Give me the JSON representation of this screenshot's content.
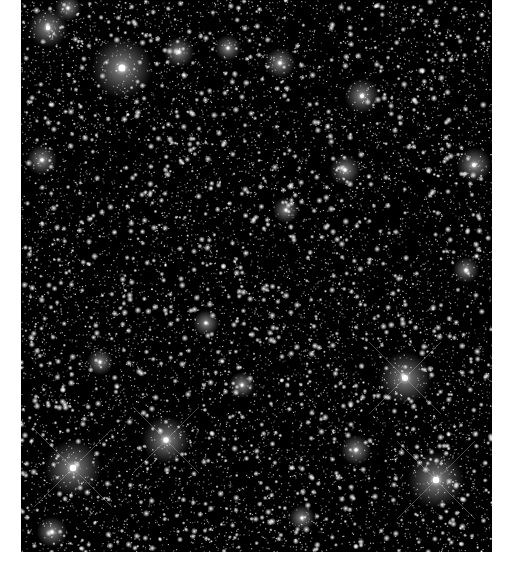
{
  "image": {
    "subject": "dense star field",
    "background_color": "#000000",
    "page_background": "#ffffff",
    "field": {
      "x": 21,
      "y": 0,
      "width": 471,
      "height": 552
    }
  },
  "stars": {
    "faint_count": 9000,
    "medium_count": 1400,
    "color": "#ffffff",
    "seed": 7
  },
  "bright_stars": [
    {
      "x": 122,
      "y": 68,
      "r": 14,
      "spikes": false
    },
    {
      "x": 48,
      "y": 28,
      "r": 9,
      "spikes": false
    },
    {
      "x": 68,
      "y": 8,
      "r": 6,
      "spikes": false
    },
    {
      "x": 179,
      "y": 52,
      "r": 7,
      "spikes": false
    },
    {
      "x": 228,
      "y": 48,
      "r": 6,
      "spikes": false
    },
    {
      "x": 280,
      "y": 63,
      "r": 7,
      "spikes": false
    },
    {
      "x": 362,
      "y": 96,
      "r": 8,
      "spikes": false
    },
    {
      "x": 474,
      "y": 165,
      "r": 8,
      "spikes": false
    },
    {
      "x": 42,
      "y": 160,
      "r": 7,
      "spikes": false
    },
    {
      "x": 345,
      "y": 170,
      "r": 7,
      "spikes": false
    },
    {
      "x": 286,
      "y": 210,
      "r": 6,
      "spikes": false
    },
    {
      "x": 405,
      "y": 378,
      "r": 12,
      "spikes": true
    },
    {
      "x": 436,
      "y": 480,
      "r": 13,
      "spikes": true
    },
    {
      "x": 73,
      "y": 468,
      "r": 13,
      "spikes": true
    },
    {
      "x": 166,
      "y": 440,
      "r": 11,
      "spikes": true
    },
    {
      "x": 356,
      "y": 450,
      "r": 7,
      "spikes": false
    },
    {
      "x": 242,
      "y": 385,
      "r": 6,
      "spikes": false
    },
    {
      "x": 206,
      "y": 323,
      "r": 6,
      "spikes": false
    },
    {
      "x": 52,
      "y": 532,
      "r": 7,
      "spikes": false
    },
    {
      "x": 302,
      "y": 518,
      "r": 6,
      "spikes": false
    },
    {
      "x": 466,
      "y": 270,
      "r": 6,
      "spikes": false
    },
    {
      "x": 100,
      "y": 362,
      "r": 6,
      "spikes": false
    }
  ]
}
